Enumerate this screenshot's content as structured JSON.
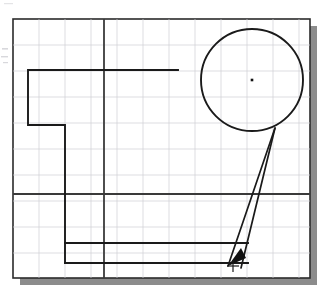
{
  "canvas": {
    "width": 331,
    "height": 298,
    "background": "#ffffff"
  },
  "drawing": {
    "title": "CAD technical sketch with grid, stepped profile, circle and leader arrow",
    "frame": {
      "x": 13,
      "y": 19,
      "width": 297,
      "height": 259,
      "stroke": "#2b2b2b",
      "stroke_width": 1.6,
      "fill": "#ffffff"
    },
    "shadow": {
      "offset_x": 7,
      "offset_y": 7,
      "color": "#8c8c8c"
    },
    "grid": {
      "spacing_x": 26,
      "spacing_y": 26,
      "origin_x": 13,
      "origin_y": 19,
      "minor_color": "#cfcfd4",
      "minor_width": 0.7,
      "visible": true
    },
    "axes": {
      "color": "#3a3a3a",
      "width": 1.8,
      "vertical_x": 104,
      "horizontal_y": 194
    },
    "geometry_stroke": "#1a1a1a",
    "geometry_width": 1.9,
    "stepped_profile": {
      "label": "stepped L-profile polyline",
      "points": "178,70 28,70 28,125 65,125 65,263"
    },
    "bottom_line_upper": {
      "label": "upper bottom horizontal line",
      "x1": 65,
      "y1": 243,
      "x2": 248,
      "y2": 243
    },
    "bottom_line_lower": {
      "label": "lower bottom horizontal line",
      "x1": 65,
      "y1": 263,
      "x2": 248,
      "y2": 263
    },
    "circle": {
      "label": "construction circle",
      "cx": 252,
      "cy": 80,
      "r": 51,
      "stroke": "#1a1a1a",
      "stroke_width": 1.9,
      "fill": "none"
    },
    "circle_center_point": {
      "label": "circle center marker",
      "cx": 252,
      "cy": 80,
      "size": 2.6,
      "color": "#111111"
    },
    "leader": {
      "label": "narrow V leader from circle to arrow tip",
      "apex_x": 275,
      "apex_y": 128,
      "tip_x": 228,
      "tip_y": 266,
      "second_x": 241,
      "second_y": 268,
      "stroke": "#1a1a1a",
      "stroke_width": 1.7
    },
    "arrowhead": {
      "label": "solid arrowhead pointing down-left",
      "points": "228,266 241,248 246,258",
      "fill": "#111111"
    },
    "cross_marker": {
      "label": "cross tick marker at leader base",
      "cx": 233,
      "cy": 266,
      "arm": 6,
      "color": "#1a1a1a",
      "width": 1.2
    },
    "scan_artifacts": {
      "label": "faint scanner smudges in left margin",
      "color": "#d8d8dc",
      "visible": true
    }
  }
}
